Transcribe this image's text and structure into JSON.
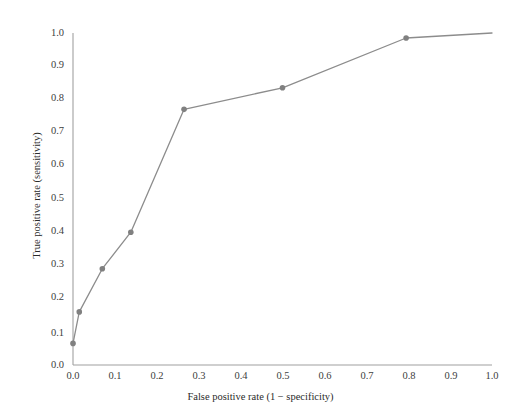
{
  "chart_data": {
    "type": "line",
    "title": "",
    "subtitle": "",
    "xlabel": "False positive rate (1 − specificity)",
    "ylabel": "True positive rate (sensitivity)",
    "xlim": [
      0.0,
      1.0
    ],
    "ylim": [
      0.0,
      1.0
    ],
    "grid": false,
    "legend": null,
    "xticks": [
      "0.0",
      "0.1",
      "0.2",
      "0.3",
      "0.4",
      "0.5",
      "0.6",
      "0.7",
      "0.8",
      "0.9",
      "1.0"
    ],
    "yticks": [
      "0.0",
      "0.1",
      "0.2",
      "0.3",
      "0.4",
      "0.5",
      "0.6",
      "0.7",
      "0.8",
      "0.9",
      "1.0"
    ],
    "xtick_values": [
      0.0,
      0.1,
      0.2,
      0.3,
      0.4,
      0.5,
      0.6,
      0.7,
      0.8,
      0.9,
      1.0
    ],
    "ytick_values": [
      0.0,
      0.1,
      0.2,
      0.3,
      0.4,
      0.5,
      0.6,
      0.7,
      0.8,
      0.9,
      1.0
    ],
    "series": [
      {
        "name": "ROC curve",
        "color": "#8c8c8c",
        "marker": "circle",
        "marker_color": "#808080",
        "x": [
          0.0,
          0.015,
          0.07,
          0.138,
          0.265,
          0.5,
          0.795,
          1.0
        ],
        "y": [
          0.065,
          0.16,
          0.29,
          0.4,
          0.77,
          0.835,
          0.985,
          1.0
        ],
        "points": [
          {
            "x": 0.0,
            "y": 0.065,
            "marker": true
          },
          {
            "x": 0.015,
            "y": 0.16,
            "marker": true
          },
          {
            "x": 0.07,
            "y": 0.29,
            "marker": true
          },
          {
            "x": 0.138,
            "y": 0.4,
            "marker": true
          },
          {
            "x": 0.265,
            "y": 0.77,
            "marker": true
          },
          {
            "x": 0.5,
            "y": 0.835,
            "marker": true
          },
          {
            "x": 0.795,
            "y": 0.985,
            "marker": true
          },
          {
            "x": 1.0,
            "y": 1.0,
            "marker": false
          }
        ]
      }
    ],
    "axis_color": "#a0a0a0",
    "text_color": "#2b2b2b"
  }
}
